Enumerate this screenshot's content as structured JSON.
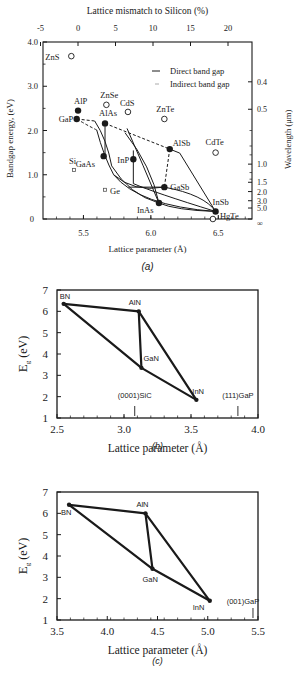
{
  "chart_data": [
    {
      "id": "a",
      "type": "scatter",
      "caption": "(a)",
      "title": "",
      "top_axis_label": "Lattice mismatch to Silicon  (%)",
      "top_ticks": [
        "-5",
        "0",
        "5",
        "10",
        "15",
        "20"
      ],
      "xlabel": "Lattice parameter (Å)",
      "ylabel": "Bandgap energy, (eV)",
      "right_axis_label": "Wavelength (μm)",
      "xlim": [
        5.2,
        6.75
      ],
      "ylim": [
        0,
        4.0
      ],
      "x_ticks": [
        "5.5",
        "6.0",
        "6.5"
      ],
      "y_ticks": [
        "0",
        "1.0",
        "2.0",
        "3.0",
        "4.0"
      ],
      "right_ticks": [
        "0.4",
        "0.5",
        "1.0",
        "1.5",
        "2.0",
        "3.0",
        "5.0",
        "∞"
      ],
      "legend": [
        {
          "label": "Direct band gap",
          "style": "solid"
        },
        {
          "label": "Indirect band gap",
          "style": "dashed"
        }
      ],
      "points": [
        {
          "name": "ZnS",
          "x": 5.41,
          "y": 3.68,
          "marker": "open"
        },
        {
          "name": "ZnSe",
          "x": 5.67,
          "y": 2.58,
          "marker": "open"
        },
        {
          "name": "CdS",
          "x": 5.83,
          "y": 2.42,
          "marker": "open"
        },
        {
          "name": "ZnTe",
          "x": 6.1,
          "y": 2.26,
          "marker": "open"
        },
        {
          "name": "CdTe",
          "x": 6.48,
          "y": 1.5,
          "marker": "open"
        },
        {
          "name": "HgTe",
          "x": 6.46,
          "y": 0.0,
          "marker": "open"
        },
        {
          "name": "AlP",
          "x": 5.46,
          "y": 2.45,
          "marker": "filled"
        },
        {
          "name": "GaP",
          "x": 5.45,
          "y": 2.26,
          "marker": "filled"
        },
        {
          "name": "AlAs",
          "x": 5.66,
          "y": 2.16,
          "marker": "filled"
        },
        {
          "name": "GaAs",
          "x": 5.65,
          "y": 1.42,
          "marker": "filled"
        },
        {
          "name": "InP",
          "x": 5.87,
          "y": 1.35,
          "marker": "filled"
        },
        {
          "name": "AlSb",
          "x": 6.14,
          "y": 1.58,
          "marker": "filled"
        },
        {
          "name": "GaSb",
          "x": 6.1,
          "y": 0.72,
          "marker": "filled"
        },
        {
          "name": "InAs",
          "x": 6.06,
          "y": 0.36,
          "marker": "filled"
        },
        {
          "name": "InSb",
          "x": 6.48,
          "y": 0.17,
          "marker": "filled"
        },
        {
          "name": "Si",
          "x": 5.43,
          "y": 1.11,
          "marker": "small-square"
        },
        {
          "name": "Ge",
          "x": 5.66,
          "y": 0.66,
          "marker": "small-square"
        }
      ]
    },
    {
      "id": "b",
      "type": "line",
      "caption": "(b)",
      "xlabel": "Lattice parameter (Å)",
      "ylabel": "Eg (eV)",
      "xlim": [
        2.5,
        4.0
      ],
      "ylim": [
        1,
        7
      ],
      "x_ticks": [
        "2.5",
        "3.0",
        "3.5",
        "4.0"
      ],
      "y_ticks": [
        "1",
        "2",
        "3",
        "4",
        "5",
        "6",
        "7"
      ],
      "points": [
        {
          "name": "BN",
          "x": 2.55,
          "y": 6.35
        },
        {
          "name": "AlN",
          "x": 3.11,
          "y": 6.0
        },
        {
          "name": "GaN",
          "x": 3.13,
          "y": 3.35
        },
        {
          "name": "InN",
          "x": 3.54,
          "y": 1.85
        }
      ],
      "substrate_markers": [
        {
          "label": "(0001)SiC",
          "x": 3.08
        },
        {
          "label": "(111)GaP",
          "x": 3.85
        }
      ]
    },
    {
      "id": "c",
      "type": "line",
      "caption": "(c)",
      "xlabel": "Lattice parameter (Å)",
      "ylabel": "Eg (eV)",
      "xlim": [
        3.5,
        5.5
      ],
      "ylim": [
        1,
        7
      ],
      "x_ticks": [
        "3.5",
        "4.0",
        "4.5",
        "5.0",
        "5.5"
      ],
      "y_ticks": [
        "1",
        "2",
        "3",
        "4",
        "5",
        "6",
        "7"
      ],
      "points": [
        {
          "name": "BN",
          "x": 3.62,
          "y": 6.4
        },
        {
          "name": "AlN",
          "x": 4.38,
          "y": 6.0
        },
        {
          "name": "GaN",
          "x": 4.45,
          "y": 3.4
        },
        {
          "name": "InN",
          "x": 5.02,
          "y": 1.9
        }
      ],
      "substrate_markers": [
        {
          "label": "(001)GaP",
          "x": 5.45
        }
      ]
    }
  ],
  "figure": {
    "a": {
      "top_axis_label": "Lattice mismatch to Silicon  (%)",
      "ylabel": "Bandgap energy, (eV)",
      "right_label": "Wavelength (μm)",
      "xlabel": "Lattice parameter (Å)",
      "caption": "(a)",
      "legend_direct": "Direct band gap",
      "legend_indirect": "Indirect band gap"
    },
    "b": {
      "xlabel": "Lattice parameter (Å)",
      "ylabel_main": "E",
      "ylabel_sub": "g",
      "ylabel_unit": " (eV)",
      "caption": "(b)"
    },
    "c": {
      "xlabel": "Lattice parameter (Å)",
      "ylabel_main": "E",
      "ylabel_sub": "g",
      "ylabel_unit": " (eV)",
      "caption": "(c)"
    }
  }
}
